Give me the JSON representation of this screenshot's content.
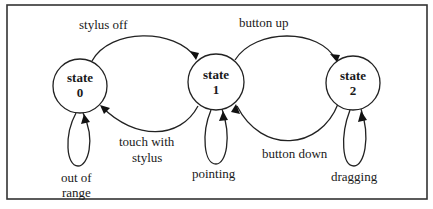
{
  "diagram": {
    "states": [
      {
        "id": "0",
        "line1": "state",
        "line2": "0"
      },
      {
        "id": "1",
        "line1": "state",
        "line2": "1"
      },
      {
        "id": "2",
        "line1": "state",
        "line2": "2"
      }
    ],
    "transitions": [
      {
        "from": "0",
        "to": "1",
        "label": "stylus off"
      },
      {
        "from": "1",
        "to": "0",
        "label_line1": "touch with",
        "label_line2": "stylus"
      },
      {
        "from": "1",
        "to": "2",
        "label": "button up"
      },
      {
        "from": "2",
        "to": "1",
        "label": "button down"
      },
      {
        "from": "0",
        "to": "0",
        "label_line1": "out of",
        "label_line2": "range"
      },
      {
        "from": "1",
        "to": "1",
        "label": "pointing"
      },
      {
        "from": "2",
        "to": "2",
        "label": "dragging"
      }
    ]
  }
}
